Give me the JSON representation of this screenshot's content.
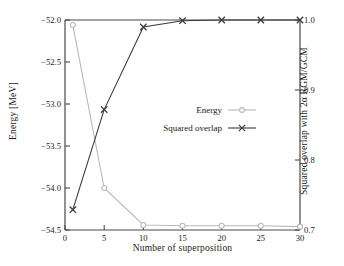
{
  "chart_data": {
    "type": "line",
    "title": "",
    "xlabel": "Number of superposition",
    "ylabel": "Energy [MeV]",
    "ylabel_right": "Squared overlap with 2α RGM/GCM",
    "xlim": [
      0,
      30
    ],
    "ylim": [
      -54.5,
      -52.0
    ],
    "ylim_right": [
      0.7,
      1.0
    ],
    "xticks": [
      0,
      5,
      10,
      15,
      20,
      25,
      30
    ],
    "xticklabels": [
      "0",
      "5",
      "10",
      "15",
      "20",
      "25",
      "30"
    ],
    "yticks": [
      -54.5,
      -54.0,
      -53.5,
      -53.0,
      -52.5,
      -52.0
    ],
    "yticklabels": [
      "−54.5",
      "−54.0",
      "−53.5",
      "−53.0",
      "−52.5",
      "−52.0"
    ],
    "yticks_right": [
      0.7,
      0.8,
      0.9,
      1.0
    ],
    "yticklabels_right": [
      "0.7",
      "0.8",
      "0.9",
      "1.0"
    ],
    "grid": false,
    "legend_position": "center-right",
    "x": [
      1,
      5,
      10,
      15,
      20,
      25,
      30
    ],
    "series": [
      {
        "name": "Energy",
        "axis": "left",
        "marker": "circle",
        "color": "#b9b9b9",
        "values": [
          -52.06,
          -54.0,
          -54.44,
          -54.45,
          -54.45,
          -54.45,
          -54.46
        ]
      },
      {
        "name": "Squared overlap",
        "axis": "right",
        "marker": "x",
        "color": "#3b3b3b",
        "values": [
          0.729,
          0.872,
          0.99,
          0.999,
          1.0,
          1.0,
          1.0
        ]
      }
    ]
  },
  "legend": {
    "entries": [
      {
        "label": "Energy"
      },
      {
        "label": "Squared overlap"
      }
    ]
  },
  "colors": {
    "energy": "#b9b9b9",
    "overlap": "#3b3b3b",
    "axis": "#4a4a4a",
    "text": "#1a1a1a",
    "background": "#ffffff"
  }
}
